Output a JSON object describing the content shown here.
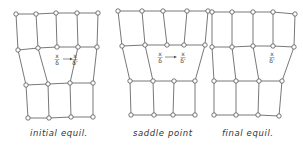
{
  "panels": [
    {
      "caption": "initial equil.",
      "caption_pos": [
        30,
        136
      ],
      "rows": [
        [
          [
            16,
            14
          ],
          [
            36,
            14
          ],
          [
            56,
            13
          ],
          [
            77,
            13
          ],
          [
            98,
            13
          ]
        ],
        [
          [
            18,
            50
          ],
          [
            38,
            48
          ],
          [
            57,
            47
          ],
          [
            78,
            47
          ],
          [
            97,
            47
          ]
        ],
        [
          [
            26,
            85
          ],
          [
            48,
            84
          ],
          [
            70,
            83
          ],
          [
            93,
            83
          ]
        ],
        [
          [
            28,
            118
          ],
          [
            49,
            118
          ],
          [
            71,
            117
          ],
          [
            93,
            117
          ]
        ]
      ],
      "vlinks_01": [
        [
          0,
          0
        ],
        [
          1,
          1
        ],
        [
          2,
          2
        ],
        [
          3,
          3
        ],
        [
          4,
          4
        ]
      ],
      "vlinks_12": [
        [
          0,
          0
        ],
        [
          1,
          1
        ],
        [
          3,
          2
        ],
        [
          4,
          3
        ]
      ],
      "labels": [
        {
          "top": "x",
          "bottom": "δ",
          "x": 57,
          "y": 60
        },
        {
          "top": "x",
          "bottom": "δ'",
          "x": 75,
          "y": 60
        }
      ],
      "arrow": {
        "x1": 63,
        "y1": 59,
        "x2": 73,
        "y2": 59
      }
    },
    {
      "caption": "saddle point",
      "caption_pos": [
        133,
        136
      ],
      "rows": [
        [
          [
            118,
            11
          ],
          [
            142,
            11
          ],
          [
            163,
            11
          ],
          [
            187,
            11
          ],
          [
            208,
            11
          ]
        ],
        [
          [
            122,
            46
          ],
          [
            145,
            45
          ],
          [
            167,
            45
          ],
          [
            184,
            45
          ],
          [
            205,
            45
          ]
        ],
        [
          [
            130,
            81
          ],
          [
            153,
            81
          ],
          [
            174,
            81
          ],
          [
            195,
            81
          ]
        ],
        [
          [
            131,
            115
          ],
          [
            154,
            115
          ],
          [
            173,
            115
          ],
          [
            195,
            115
          ]
        ]
      ],
      "vlinks_01": [
        [
          0,
          0
        ],
        [
          1,
          1
        ],
        [
          2,
          2
        ],
        [
          3,
          3
        ],
        [
          4,
          4
        ]
      ],
      "vlinks_12": [
        [
          0,
          0
        ],
        [
          1,
          1
        ],
        [
          4,
          3
        ]
      ],
      "labels": [
        {
          "top": "x",
          "bottom": "δ",
          "x": 160,
          "y": 58
        },
        {
          "top": "x",
          "bottom": "δ'",
          "x": 183,
          "y": 58
        }
      ],
      "arrow": {
        "x1": 165,
        "y1": 57,
        "x2": 177,
        "y2": 57
      }
    },
    {
      "caption": "final equil.",
      "caption_pos": [
        222,
        136
      ],
      "rows": [
        [
          [
            212,
            12
          ],
          [
            232,
            12
          ],
          [
            253,
            12
          ],
          [
            273,
            12
          ],
          [
            295,
            14
          ]
        ],
        [
          [
            212,
            47
          ],
          [
            232,
            47
          ],
          [
            253,
            46
          ],
          [
            273,
            46
          ],
          [
            294,
            47
          ]
        ],
        [
          [
            214,
            81
          ],
          [
            236,
            81
          ],
          [
            259,
            81
          ],
          [
            282,
            81
          ]
        ],
        [
          [
            214,
            115
          ],
          [
            236,
            115
          ],
          [
            258,
            115
          ],
          [
            279,
            116
          ]
        ]
      ],
      "vlinks_01": [
        [
          0,
          0
        ],
        [
          1,
          1
        ],
        [
          2,
          2
        ],
        [
          3,
          3
        ],
        [
          4,
          4
        ]
      ],
      "vlinks_12": [
        [
          0,
          0
        ],
        [
          1,
          1
        ],
        [
          2,
          2
        ],
        [
          4,
          3
        ]
      ],
      "labels": [
        {
          "top": "x",
          "bottom": "δ'",
          "x": 272,
          "y": 58
        }
      ],
      "arrow": null
    }
  ],
  "diagram_elements": {
    "edge_color": "#555555",
    "node_fill": "#ffffff",
    "node_radius": 2.2
  }
}
